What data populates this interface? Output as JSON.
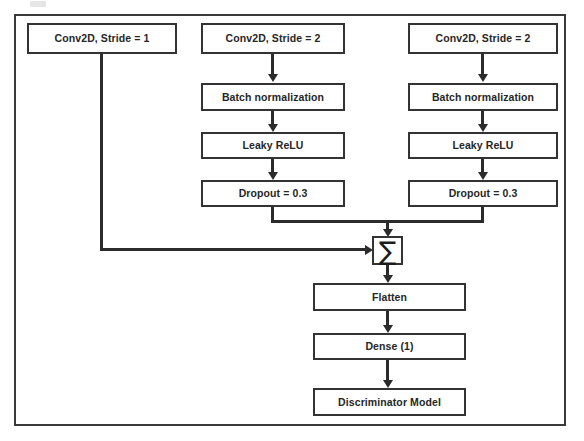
{
  "diagram": {
    "type": "flowchart",
    "colors": {
      "box_border": "#333333",
      "box_fill": "#ffffff",
      "connector": "#2b2b2b",
      "frame_border": "#3a3a3a",
      "text": "#262626"
    },
    "branches": [
      {
        "id": "left-branch",
        "nodes": [
          {
            "id": "left-conv",
            "label": "Conv2D, Stride = 1"
          }
        ]
      },
      {
        "id": "middle-branch",
        "nodes": [
          {
            "id": "mid-conv",
            "label": "Conv2D, Stride = 2"
          },
          {
            "id": "mid-batchnorm",
            "label": "Batch normalization"
          },
          {
            "id": "mid-leakyrelu",
            "label": "Leaky ReLU"
          },
          {
            "id": "mid-dropout",
            "label": "Dropout = 0.3"
          }
        ]
      },
      {
        "id": "right-branch",
        "nodes": [
          {
            "id": "right-conv",
            "label": "Conv2D, Stride = 2"
          },
          {
            "id": "right-batchnorm",
            "label": "Batch normalization"
          },
          {
            "id": "right-leakyrelu",
            "label": "Leaky ReLU"
          },
          {
            "id": "right-dropout",
            "label": "Dropout = 0.3"
          }
        ]
      }
    ],
    "merge": {
      "id": "sum-node",
      "label": "∑",
      "symbol_name": "summation-sigma"
    },
    "tail": {
      "nodes": [
        {
          "id": "flatten",
          "label": "Flatten"
        },
        {
          "id": "dense",
          "label": "Dense (1)"
        },
        {
          "id": "output",
          "label": "Discriminator Model"
        }
      ]
    },
    "connections": [
      {
        "from": "left-conv",
        "to": "sum-node",
        "style": "elbow-left"
      },
      {
        "from": "mid-conv",
        "to": "mid-batchnorm",
        "style": "straight-down"
      },
      {
        "from": "mid-batchnorm",
        "to": "mid-leakyrelu",
        "style": "straight-down"
      },
      {
        "from": "mid-leakyrelu",
        "to": "mid-dropout",
        "style": "straight-down"
      },
      {
        "from": "mid-dropout",
        "to": "sum-node",
        "style": "elbow-merge"
      },
      {
        "from": "right-conv",
        "to": "right-batchnorm",
        "style": "straight-down"
      },
      {
        "from": "right-batchnorm",
        "to": "right-leakyrelu",
        "style": "straight-down"
      },
      {
        "from": "right-leakyrelu",
        "to": "right-dropout",
        "style": "straight-down"
      },
      {
        "from": "right-dropout",
        "to": "sum-node",
        "style": "elbow-merge"
      },
      {
        "from": "sum-node",
        "to": "flatten",
        "style": "straight-down"
      },
      {
        "from": "flatten",
        "to": "dense",
        "style": "straight-down"
      },
      {
        "from": "dense",
        "to": "output",
        "style": "straight-down"
      }
    ]
  }
}
